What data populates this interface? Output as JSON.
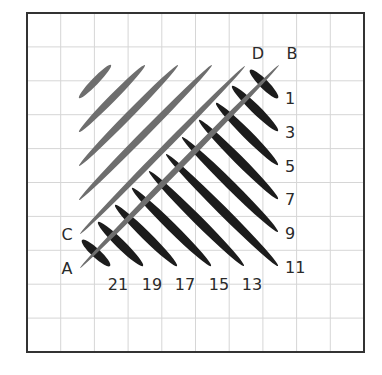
{
  "diagram": {
    "frame": {
      "x": 27,
      "y": 13,
      "width": 337,
      "height": 339,
      "color": "#333333",
      "stroke_width": 2
    },
    "grid": {
      "columns": 10,
      "rows": 10,
      "color": "#d6d6d6"
    },
    "colors": {
      "gray_ellipse": "#6e6e6e",
      "black_ellipse": "#1c1c1c",
      "label": "#2a2a2a"
    },
    "gray_ellipses": [
      {
        "name": "gray-ellipse-1",
        "x1": 79,
        "y1": 98,
        "x2": 111,
        "y2": 65,
        "width": 7
      },
      {
        "name": "gray-ellipse-2",
        "x1": 79,
        "y1": 132,
        "x2": 145,
        "y2": 65,
        "width": 7
      },
      {
        "name": "gray-ellipse-3",
        "x1": 79,
        "y1": 166,
        "x2": 178,
        "y2": 65,
        "width": 7
      },
      {
        "name": "gray-ellipse-4",
        "x1": 79,
        "y1": 200,
        "x2": 212,
        "y2": 65,
        "width": 7
      }
    ],
    "black_ellipses": [
      {
        "label": "1",
        "x1": 250,
        "y1": 70,
        "x2": 278,
        "y2": 98,
        "width": 9
      },
      {
        "label": "3",
        "x1": 232,
        "y1": 86,
        "x2": 278,
        "y2": 131,
        "width": 9
      },
      {
        "label": "5",
        "x1": 216,
        "y1": 103,
        "x2": 278,
        "y2": 165,
        "width": 9
      },
      {
        "label": "7",
        "x1": 199,
        "y1": 120,
        "x2": 278,
        "y2": 199,
        "width": 9
      },
      {
        "label": "9",
        "x1": 182,
        "y1": 137,
        "x2": 278,
        "y2": 232,
        "width": 9
      },
      {
        "label": "11",
        "x1": 166,
        "y1": 154,
        "x2": 278,
        "y2": 266,
        "width": 9
      },
      {
        "label": "13",
        "x1": 149,
        "y1": 171,
        "x2": 244,
        "y2": 266,
        "width": 9
      },
      {
        "label": "15",
        "x1": 132,
        "y1": 188,
        "x2": 211,
        "y2": 266,
        "width": 9
      },
      {
        "label": "17",
        "x1": 115,
        "y1": 205,
        "x2": 177,
        "y2": 266,
        "width": 9
      },
      {
        "label": "19",
        "x1": 98,
        "y1": 222,
        "x2": 143,
        "y2": 266,
        "width": 9
      },
      {
        "label": "21",
        "x1": 82,
        "y1": 240,
        "x2": 110,
        "y2": 266,
        "width": 9
      }
    ],
    "lines": [
      {
        "name": "line-CD",
        "start_label": "C",
        "end_label": "D",
        "x1": 80,
        "y1": 234,
        "x2": 245,
        "y2": 66,
        "width": 6
      },
      {
        "name": "line-AB",
        "start_label": "A",
        "end_label": "B",
        "x1": 80,
        "y1": 268,
        "x2": 279,
        "y2": 65,
        "width": 6
      }
    ],
    "point_labels": [
      {
        "text": "A",
        "x": 67,
        "y": 274
      },
      {
        "text": "B",
        "x": 292,
        "y": 59
      },
      {
        "text": "C",
        "x": 67,
        "y": 240
      },
      {
        "text": "D",
        "x": 258,
        "y": 59
      }
    ],
    "right_labels": [
      {
        "text": "1",
        "x": 285,
        "y": 104
      },
      {
        "text": "3",
        "x": 285,
        "y": 138
      },
      {
        "text": "5",
        "x": 285,
        "y": 172
      },
      {
        "text": "7",
        "x": 285,
        "y": 205
      },
      {
        "text": "9",
        "x": 285,
        "y": 239
      },
      {
        "text": "11",
        "x": 285,
        "y": 273
      }
    ],
    "bottom_labels": [
      {
        "text": "21",
        "x": 118,
        "y": 290
      },
      {
        "text": "19",
        "x": 152,
        "y": 290
      },
      {
        "text": "17",
        "x": 185,
        "y": 290
      },
      {
        "text": "15",
        "x": 219,
        "y": 290
      },
      {
        "text": "13",
        "x": 252,
        "y": 290
      }
    ]
  }
}
